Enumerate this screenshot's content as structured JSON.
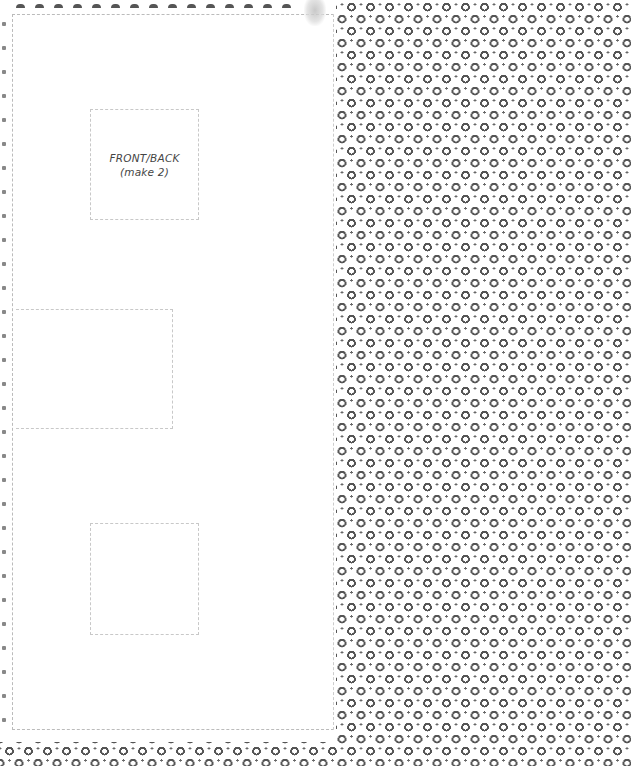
{
  "pattern_pieces": [
    {
      "id": "front-back",
      "label": "FRONT/BACK",
      "sublabel": "(make 2)"
    },
    {
      "id": "middle-rect",
      "label": "",
      "sublabel": ""
    },
    {
      "id": "bottom-square",
      "label": "",
      "sublabel": ""
    }
  ],
  "colors": {
    "background": "#ffffff",
    "pattern_ink": "#555555",
    "cut_line": "#c8c8c8"
  }
}
